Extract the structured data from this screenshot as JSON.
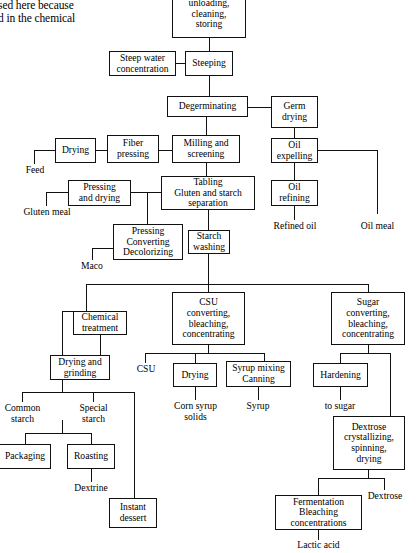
{
  "figure": {
    "type": "process-flow-diagram",
    "background": "#ffffff",
    "line_color": "#111111"
  },
  "caption_fragment": {
    "line1": "sed here because",
    "line2": "d in the chemical"
  },
  "nodes": {
    "unloading": "unloading,\ncleaning,\nstoring",
    "steep_water": "Steep water\nconcentration",
    "steeping": "Steeping",
    "degerminating": "Degerminating",
    "germ_drying": "Germ\ndrying",
    "drying_fiber": "Drying",
    "fiber_pressing": "Fiber\npressing",
    "milling": "Milling and\nscreening",
    "oil_expelling": "Oil\nexpelling",
    "oil_refining": "Oil\nrefining",
    "pressing_drying": "Pressing\nand drying",
    "tabling": "Tabling\nGluten and starch\nseparation",
    "pressing_converting": "Pressing\nConverting\nDecolorizing",
    "starch_washing": "Starch\nwashing",
    "chemical_treatment": "Chemical\ntreatment",
    "csu_converting": "CSU\nconverting,\nbleaching,\nconcentrating",
    "sugar_converting": "Sugar\nconverting,\nbleaching,\nconcentrating",
    "drying_grinding": "Drying and\ngrinding",
    "drying_csu": "Drying",
    "syrup_mixing": "Syrup mixing\nCanning",
    "hardening": "Hardening",
    "dextrose_cryst": "Dextrose\ncrystallizing,\nspinning,\ndrying",
    "packaging": "Packaging",
    "roasting": "Roasting",
    "instant_dessert": "Instant\ndessert",
    "fermentation": "Fermentation\nBleaching\nconcentrations"
  },
  "terminals": {
    "feed": "Feed",
    "gluten_meal": "Gluten meal",
    "maco": "Maco",
    "refined_oil": "Refined oil",
    "oil_meal": "Oil meal",
    "csu": "CSU",
    "corn_syrup_solids": "Corn syrup\nsolids",
    "syrup": "Syrup",
    "to_sugar": "to sugar",
    "common_starch": "Common\nstarch",
    "special_starch": "Special\nstarch",
    "dextrine": "Dextrine",
    "dextrose": "Dextrose",
    "lactic_acid": "Lactic acid"
  }
}
